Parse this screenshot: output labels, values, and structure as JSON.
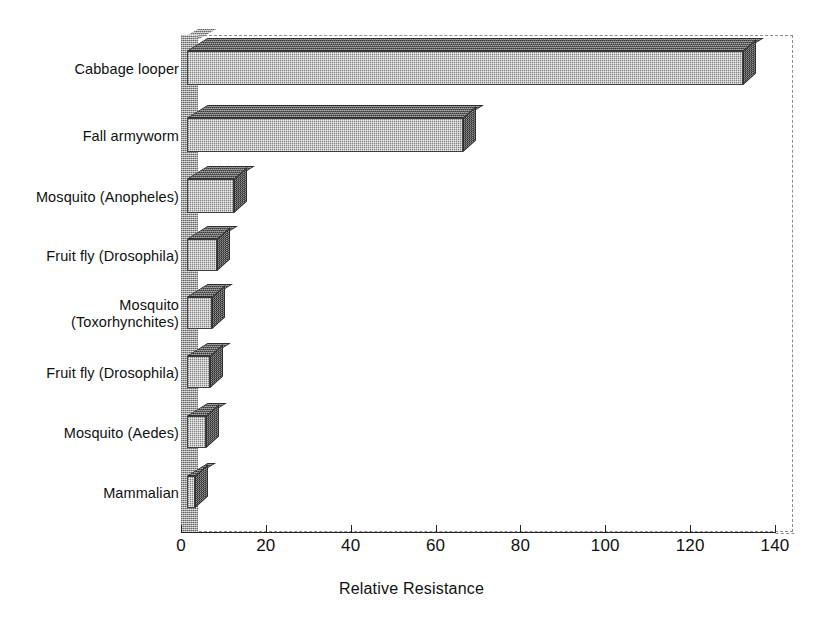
{
  "chart_data": {
    "type": "bar",
    "orientation": "horizontal",
    "style": "3d-grayscale",
    "title": "",
    "xlabel": "Relative Resistance",
    "ylabel": "",
    "xlim": [
      0,
      140
    ],
    "xticks": [
      0,
      20,
      40,
      60,
      80,
      100,
      120,
      140
    ],
    "xtick_labels": [
      "0",
      "20",
      "40",
      "60",
      "80",
      "100",
      "120",
      "140"
    ],
    "grid": false,
    "legend": null,
    "categories": [
      "Cabbage looper",
      "Fall armyworm",
      "Mosquito (Anopheles)",
      "Fruit fly (Drosophila)",
      "Mosquito\n(Toxorhynchites)",
      "Fruit fly (Drosophila)",
      "Mosquito (Aedes)",
      "Mammalian"
    ],
    "values": [
      131,
      65,
      11,
      7,
      6,
      5.5,
      4.5,
      2
    ],
    "colors": {
      "bar_front": "#b4b4b4",
      "bar_top": "#5e5e5e",
      "bar_side": "#4a4a4a",
      "axis_wall": "#a9a9a9",
      "frame": "#8d8d8d",
      "text": "#111111",
      "background": "#ffffff"
    }
  },
  "axis": {
    "x_title": "Relative Resistance",
    "ticks": [
      {
        "label": "0",
        "value": 0
      },
      {
        "label": "20",
        "value": 20
      },
      {
        "label": "40",
        "value": 40
      },
      {
        "label": "60",
        "value": 60
      },
      {
        "label": "80",
        "value": 80
      },
      {
        "label": "100",
        "value": 100
      },
      {
        "label": "120",
        "value": 120
      },
      {
        "label": "140",
        "value": 140
      }
    ]
  },
  "bars": [
    {
      "label": "Cabbage looper",
      "value": 131
    },
    {
      "label": "Fall armyworm",
      "value": 65
    },
    {
      "label": "Mosquito (Anopheles)",
      "value": 11
    },
    {
      "label": "Fruit fly (Drosophila)",
      "value": 7
    },
    {
      "label": "Mosquito\n(Toxorhynchites)",
      "value": 6
    },
    {
      "label": "Fruit fly (Drosophila)",
      "value": 5.5
    },
    {
      "label": "Mosquito (Aedes)",
      "value": 4.5
    },
    {
      "label": "Mammalian",
      "value": 2
    }
  ]
}
